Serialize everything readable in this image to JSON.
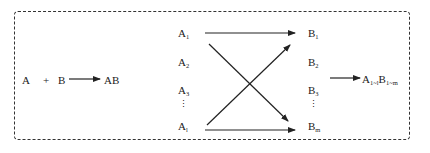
{
  "diagram": {
    "type": "reaction-scheme",
    "left_reaction": {
      "reactant_a": "A",
      "plus": "+",
      "reactant_b": "B",
      "product": "AB"
    },
    "a_column": [
      {
        "base": "A",
        "sub": "1"
      },
      {
        "base": "A",
        "sub": "2"
      },
      {
        "base": "A",
        "sub": "3"
      },
      {
        "base": "A",
        "sub": "l"
      }
    ],
    "b_column": [
      {
        "base": "B",
        "sub": "1"
      },
      {
        "base": "B",
        "sub": "2"
      },
      {
        "base": "B",
        "sub": "3"
      },
      {
        "base": "B",
        "sub": "m"
      }
    ],
    "ellipsis": "⋮",
    "result": {
      "a_base": "A",
      "a_sub": "1~l",
      "b_base": "B",
      "b_sub": "1~m"
    },
    "line_color": "#222222",
    "border_style": "dashed"
  }
}
